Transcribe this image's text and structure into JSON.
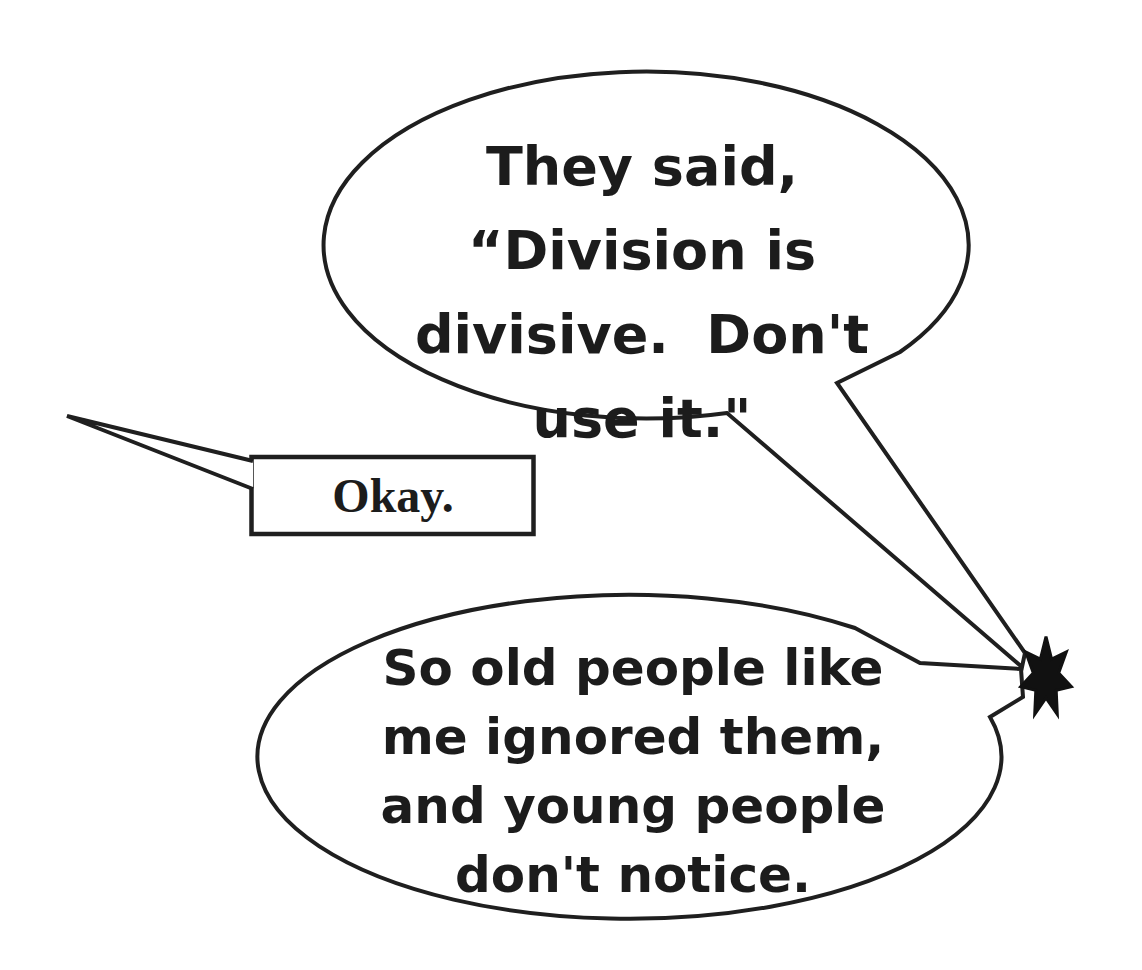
{
  "figure": {
    "background_color": "#ffffff",
    "ink_color": "#1f1f1f",
    "top_bubble": {
      "shape": "ellipse-callout",
      "lines": [
        "They said,",
        "“Division is",
        "divisive.  Don't",
        "use it.\""
      ]
    },
    "okay_callout": {
      "shape": "rectangle-callout",
      "label": "Okay."
    },
    "bottom_bubble": {
      "shape": "ellipse-callout",
      "lines": [
        "So old people like",
        "me ignored them,",
        "and young people",
        "don't notice."
      ]
    },
    "star": {
      "shape": "seven-point-star",
      "color": "#111111"
    }
  }
}
